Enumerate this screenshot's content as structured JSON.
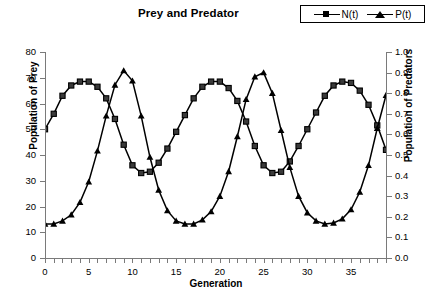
{
  "chart_data": {
    "type": "line",
    "title": "Prey and Predator",
    "xlabel": "Generation",
    "ylabel": "Population of Prey",
    "y2label": "Population of Predators",
    "grid": false,
    "legend_position": "top-right",
    "xlim": [
      0,
      39
    ],
    "ylim": [
      0,
      80
    ],
    "y2lim": [
      0.0,
      1.0
    ],
    "xticks": [
      0,
      1,
      2,
      3,
      4,
      5,
      6,
      7,
      8,
      9,
      10,
      11,
      12,
      13,
      14,
      15,
      16,
      17,
      18,
      19,
      20,
      21,
      22,
      23,
      24,
      25,
      26,
      27,
      28,
      29,
      30,
      31,
      32,
      33,
      34,
      35,
      36,
      37,
      38,
      39
    ],
    "xtick_labels": [
      "0",
      "5",
      "10",
      "15",
      "20",
      "25",
      "30",
      "35"
    ],
    "xtick_label_values": [
      0,
      5,
      10,
      15,
      20,
      25,
      30,
      35
    ],
    "ytick_labels": [
      "0",
      "10",
      "20",
      "30",
      "40",
      "50",
      "60",
      "70",
      "80"
    ],
    "ytick_values": [
      0,
      10,
      20,
      30,
      40,
      50,
      60,
      70,
      80
    ],
    "y2tick_labels": [
      "0.0",
      "0.1",
      "0.2",
      "0.3",
      "0.4",
      "0.5",
      "0.6",
      "0.7",
      "0.8",
      "0.9",
      "1.0"
    ],
    "y2tick_values": [
      0.0,
      0.1,
      0.2,
      0.3,
      0.4,
      0.5,
      0.6,
      0.7,
      0.8,
      0.9,
      1.0
    ],
    "x": [
      0,
      1,
      2,
      3,
      4,
      5,
      6,
      7,
      8,
      9,
      10,
      11,
      12,
      13,
      14,
      15,
      16,
      17,
      18,
      19,
      20,
      21,
      22,
      23,
      24,
      25,
      26,
      27,
      28,
      29,
      30,
      31,
      32,
      33,
      34,
      35,
      36,
      37,
      38,
      39
    ],
    "series": [
      {
        "name": "N(t)",
        "axis": "left",
        "marker": "square",
        "color": "#000000",
        "values": [
          50,
          56,
          63,
          67,
          68.5,
          68.5,
          66.5,
          62,
          54,
          44,
          36,
          33,
          33.5,
          37,
          42.5,
          49,
          55.5,
          62,
          66.5,
          68.5,
          68.5,
          66,
          61,
          53,
          43.5,
          36,
          33,
          33.5,
          37.5,
          43.5,
          50,
          56.5,
          63,
          67,
          68.5,
          68,
          65,
          59.5,
          51.5,
          42
        ]
      },
      {
        "name": "P(t)",
        "axis": "right",
        "marker": "triangle",
        "color": "#000000",
        "values": [
          0.165,
          0.165,
          0.18,
          0.21,
          0.27,
          0.37,
          0.52,
          0.69,
          0.84,
          0.91,
          0.86,
          0.69,
          0.49,
          0.33,
          0.23,
          0.18,
          0.165,
          0.165,
          0.185,
          0.225,
          0.3,
          0.42,
          0.59,
          0.77,
          0.88,
          0.9,
          0.8,
          0.62,
          0.44,
          0.3,
          0.22,
          0.18,
          0.165,
          0.17,
          0.19,
          0.235,
          0.32,
          0.45,
          0.63,
          0.79
        ]
      }
    ]
  },
  "legend": {
    "entries": [
      {
        "label": "N(t)",
        "marker": "square-marker-icon"
      },
      {
        "label": "P(t)",
        "marker": "triangle-marker-icon"
      }
    ]
  }
}
